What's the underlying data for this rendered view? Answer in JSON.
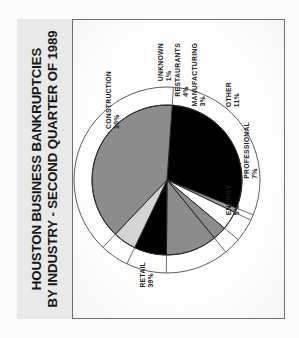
{
  "document": {
    "title_line_1": "HOUSTON BUSINESS BANKRUPTCIES",
    "title_line_2": "BY INDUSTRY - SECOND QUARTER OF 1989"
  },
  "chart_data": {
    "type": "pie",
    "title": "HOUSTON BUSINESS BANKRUPTCIES BY INDUSTRY - SECOND QUARTER OF 1989",
    "xlabel": "",
    "ylabel": "",
    "units": "percent",
    "legend_position": "labels-outside-with-leader-lines",
    "grid": false,
    "categories": [
      "CONSTRUCTION",
      "UNKNOWN",
      "RESTAURANTS",
      "MANUFACTURING",
      "OTHER",
      "PROFESSIONAL",
      "ENERGY",
      "RETAIL"
    ],
    "values": [
      30,
      1,
      4,
      3,
      11,
      7,
      5,
      39
    ],
    "slices": [
      {
        "label": "CONSTRUCTION",
        "value": 30,
        "value_text": "30%",
        "color": "#000000"
      },
      {
        "label": "UNKNOWN",
        "value": 1,
        "value_text": "1%",
        "color": "#9a9a9a"
      },
      {
        "label": "RESTAURANTS",
        "value": 4,
        "value_text": "4%",
        "color": "#ffffff"
      },
      {
        "label": "MANUFACTURING",
        "value": 3,
        "value_text": "3%",
        "color": "#8c8c8c"
      },
      {
        "label": "OTHER",
        "value": 11,
        "value_text": "11%",
        "color": "#8c8c8c"
      },
      {
        "label": "PROFESSIONAL",
        "value": 7,
        "value_text": "7%",
        "color": "#000000"
      },
      {
        "label": "ENERGY",
        "value": 5,
        "value_text": "5%",
        "color": "#d4d4d4"
      },
      {
        "label": "RETAIL",
        "value": 39,
        "value_text": "39%",
        "color": "#8c8c8c"
      }
    ],
    "total": 100
  }
}
